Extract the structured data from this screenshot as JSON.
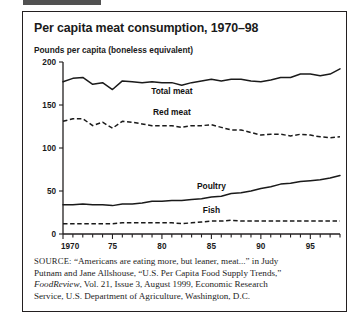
{
  "page": {
    "clipped_top_text": ""
  },
  "figure": {
    "title": "Per capita meat consumption, 1970–98",
    "unit_label": "Pounds per capita (boneless equivalent)"
  },
  "source": {
    "lead": "SOURCE:",
    "line1": " “Americans are eating more, but leaner, meat...” in Judy",
    "line2": "Putnam and Jane Allshouse, “U.S. Per Capita Food Supply Trends,”",
    "line3_italic": "FoodReview",
    "line3_rest": ", Vol. 21, Issue 3, August 1999, Economic Research",
    "line4": "Service, U.S. Department of Agriculture, Washington, D.C."
  },
  "chart_data": {
    "type": "line",
    "title": "Per capita meat consumption, 1970–98",
    "xlabel": "",
    "ylabel": "Pounds per capita (boneless equivalent)",
    "xlim": [
      1970,
      1998
    ],
    "ylim": [
      0,
      200
    ],
    "grid": false,
    "legend_position": "inline-labels",
    "y_ticks": [
      0,
      50,
      100,
      150,
      200
    ],
    "y_tick_labels": [
      "0",
      "50",
      "100",
      "150",
      "200"
    ],
    "x_ticks": [
      1970,
      1975,
      1980,
      1985,
      1990,
      1995
    ],
    "x_tick_labels": [
      "1970",
      "75",
      "80",
      "85",
      "90",
      "95"
    ],
    "x": [
      1970,
      1971,
      1972,
      1973,
      1974,
      1975,
      1976,
      1977,
      1978,
      1979,
      1980,
      1981,
      1982,
      1983,
      1984,
      1985,
      1986,
      1987,
      1988,
      1989,
      1990,
      1991,
      1992,
      1993,
      1994,
      1995,
      1996,
      1997,
      1998
    ],
    "series": [
      {
        "name": "Total meat",
        "style": "solid",
        "label_x": 1981,
        "label_y": 163,
        "values": [
          177,
          181,
          182,
          174,
          176,
          168,
          178,
          177,
          176,
          177,
          176,
          176,
          173,
          176,
          178,
          180,
          178,
          180,
          180,
          178,
          177,
          179,
          182,
          182,
          186,
          186,
          184,
          186,
          192
        ]
      },
      {
        "name": "Red meat",
        "style": "dashed",
        "label_x": 1981,
        "label_y": 138,
        "values": [
          131,
          134,
          134,
          126,
          130,
          123,
          131,
          130,
          128,
          126,
          126,
          126,
          124,
          126,
          126,
          127,
          124,
          121,
          121,
          118,
          115,
          116,
          116,
          114,
          116,
          115,
          113,
          112,
          113
        ]
      },
      {
        "name": "Poultry",
        "style": "solid",
        "label_x": 1985,
        "label_y": 52,
        "values": [
          34,
          34,
          35,
          34,
          34,
          33,
          35,
          35,
          36,
          38,
          38,
          39,
          39,
          40,
          41,
          43,
          44,
          47,
          48,
          50,
          53,
          55,
          58,
          59,
          61,
          62,
          63,
          65,
          68
        ]
      },
      {
        "name": "Fish",
        "style": "dashed",
        "label_x": 1985,
        "label_y": 24,
        "values": [
          12,
          12,
          12,
          12,
          12,
          12,
          13,
          13,
          13,
          13,
          13,
          13,
          12,
          13,
          14,
          15,
          15,
          16,
          15,
          15,
          15,
          15,
          15,
          15,
          15,
          15,
          15,
          15,
          15
        ]
      }
    ]
  }
}
